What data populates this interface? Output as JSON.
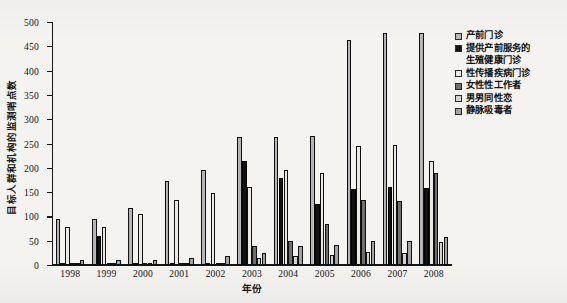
{
  "chart_data": {
    "type": "bar",
    "title": "",
    "xlabel": "年份",
    "ylabel": "目标人群和机构的监测哨点数",
    "ylim": [
      0,
      500
    ],
    "yticks": [
      0,
      50,
      100,
      150,
      200,
      250,
      300,
      350,
      400,
      450,
      500
    ],
    "grid": false,
    "legend_position": "right",
    "categories": [
      "1998",
      "1999",
      "2000",
      "2001",
      "2002",
      "2003",
      "2004",
      "2005",
      "2006",
      "2007",
      "2008"
    ],
    "series": [
      {
        "name": "产前门诊",
        "color": "#b6b6b6",
        "values": [
          95,
          94,
          118,
          172,
          196,
          263,
          263,
          266,
          464,
          478,
          478
        ]
      },
      {
        "name": "提供产前服务的生殖健康门诊",
        "color": "#121212",
        "values": [
          5,
          60,
          5,
          4,
          5,
          214,
          180,
          125,
          157,
          160,
          158
        ]
      },
      {
        "name": "性传播疾病门诊",
        "color": "#ebe9e6",
        "values": [
          78,
          79,
          105,
          133,
          149,
          160,
          196,
          190,
          245,
          246,
          215
        ]
      },
      {
        "name": "女性性工作者",
        "color": "#6f6f6f",
        "values": [
          3,
          3,
          3,
          3,
          3,
          39,
          50,
          84,
          134,
          132,
          190
        ]
      },
      {
        "name": "男男同性恋",
        "color": "#d6d4d1",
        "values": [
          2,
          2,
          2,
          2,
          2,
          14,
          18,
          20,
          26,
          24,
          48
        ]
      },
      {
        "name": "静脉吸毒者",
        "color": "#a3a3a3",
        "values": [
          10,
          11,
          10,
          15,
          18,
          24,
          40,
          42,
          50,
          50,
          57
        ]
      }
    ]
  },
  "legend": {
    "entries": [
      {
        "label": "产前门诊",
        "swatch": "#b6b6b6",
        "continuation": ""
      },
      {
        "label": "提供产前服务的",
        "swatch": "#121212",
        "continuation": "生殖健康门诊"
      },
      {
        "label": "性传播疾病门诊",
        "swatch": "#ebe9e6",
        "continuation": ""
      },
      {
        "label": "女性性工作者",
        "swatch": "#6f6f6f",
        "continuation": ""
      },
      {
        "label": "男男同性恋",
        "swatch": "#d6d4d1",
        "continuation": ""
      },
      {
        "label": "静脉吸毒者",
        "swatch": "#a3a3a3",
        "continuation": ""
      }
    ]
  }
}
